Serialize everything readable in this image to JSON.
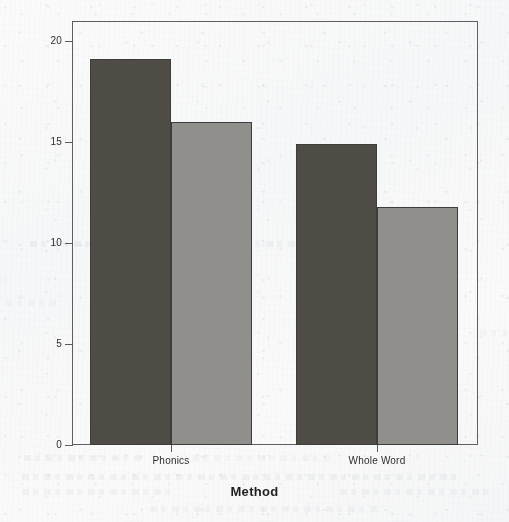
{
  "chart_data": {
    "type": "bar",
    "title": "",
    "subtitle": "",
    "xlabel": "Method",
    "ylabel": "Mean Mean New Words",
    "categories": [
      "Phonics",
      "Whole Word"
    ],
    "series": [
      {
        "name": "series-1",
        "color": "#4d4a44",
        "values": [
          19.1,
          14.9
        ]
      },
      {
        "name": "series-2",
        "color": "#908f8b",
        "values": [
          16.0,
          11.8
        ]
      }
    ],
    "ylim": [
      0,
      21
    ],
    "yticks": [
      0,
      5,
      10,
      15,
      20
    ],
    "ytick_labels": [
      "0",
      "5",
      "10",
      "15",
      "20"
    ],
    "xtick_labels": [
      "Phonics",
      "Whole Word"
    ],
    "grid": false,
    "legend": "none",
    "axis_line_color": "#5e5e60",
    "plot_background": "#f7f8f9"
  },
  "axes": {
    "y_title": "Mean Mean New Words",
    "x_title": "Method",
    "y_ticks": [
      {
        "label": "20",
        "value": 20
      },
      {
        "label": "15",
        "value": 15
      },
      {
        "label": "10",
        "value": 10
      },
      {
        "label": "5",
        "value": 5
      },
      {
        "label": "0",
        "value": 0
      }
    ],
    "x_ticks": [
      {
        "label": "Phonics"
      },
      {
        "label": "Whole Word"
      }
    ]
  },
  "bars": [
    {
      "id": "bar-phonics-dark",
      "group": "Phonics",
      "series": "series-1",
      "value": 19.1,
      "color": "#4d4a44"
    },
    {
      "id": "bar-phonics-light",
      "group": "Phonics",
      "series": "series-2",
      "value": 16.0,
      "color": "#908f8b"
    },
    {
      "id": "bar-wholeword-dark",
      "group": "Whole Word",
      "series": "series-1",
      "value": 14.9,
      "color": "#4d4a44"
    },
    {
      "id": "bar-wholeword-light",
      "group": "Whole Word",
      "series": "series-2",
      "value": 11.8,
      "color": "#908f8b"
    }
  ]
}
